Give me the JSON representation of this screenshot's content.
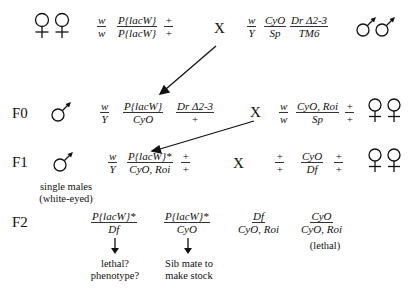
{
  "p_cross": {
    "female_symbol": "female-female",
    "female_genotype": [
      {
        "num": "w",
        "den": "w"
      },
      {
        "num": "P{lacW}",
        "den": "P{lacW}"
      },
      {
        "num": "+",
        "den": "+"
      }
    ],
    "cross_label": "X",
    "male_genotype": [
      {
        "num": "w",
        "den": "Y"
      },
      {
        "num": "CyO",
        "den": "Sp"
      },
      {
        "num": "Dr Δ2-3",
        "den": "TM6"
      }
    ],
    "male_symbol": "male-male"
  },
  "f0": {
    "label": "F0",
    "male_genotype": [
      {
        "num": "w",
        "den": "Y"
      },
      {
        "num": "P{lacW}",
        "den": "CyO"
      },
      {
        "num": "Dr Δ2-3",
        "den": "+"
      }
    ],
    "cross_label": "X",
    "female_genotype": [
      {
        "num": "w",
        "den": "w"
      },
      {
        "num": "CyO, Roi",
        "den": "Sp"
      },
      {
        "num": "+",
        "den": "+"
      }
    ]
  },
  "f1": {
    "label": "F1",
    "male_note_line1": "single males",
    "male_note_line2": "(white-eyed)",
    "male_genotype": [
      {
        "num": "w",
        "den": "Y"
      },
      {
        "num": "P{lacW}*",
        "den": "CyO, Roi"
      },
      {
        "num": "+",
        "den": "+"
      }
    ],
    "cross_label": "X",
    "female_genotype": [
      {
        "num": "+",
        "den": "+"
      },
      {
        "num": "CyO",
        "den": "Df"
      },
      {
        "num": "+",
        "den": "+"
      }
    ]
  },
  "f2": {
    "label": "F2",
    "progeny": [
      {
        "num": "P{lacW}*",
        "den": "Df",
        "note_line1": "lethal?",
        "note_line2": "phenotype?"
      },
      {
        "num": "P{lacW}*",
        "den": "CyO",
        "note_line1": "Sib mate to",
        "note_line2": "make stock"
      },
      {
        "num": "Df",
        "den": "CyO, Roi"
      },
      {
        "num": "CyO",
        "den": "CyO, Roi",
        "note_line1": "(lethal)"
      }
    ]
  }
}
